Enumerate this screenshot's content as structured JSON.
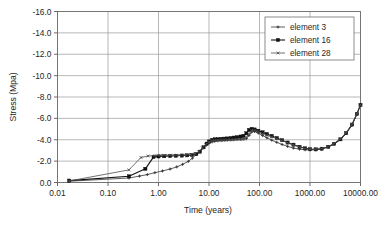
{
  "chart_data": {
    "type": "line",
    "title": "",
    "xlabel": "Time (years)",
    "ylabel": "Stress (Mpa)",
    "xscale": "log",
    "xlim": [
      0.01,
      10000
    ],
    "ylim": [
      0.0,
      -16.0
    ],
    "grid": true,
    "legend_position": "top-right",
    "xticks": [
      0.01,
      0.1,
      1,
      10,
      100,
      1000,
      10000
    ],
    "xtick_labels": [
      "0.01",
      "0.10",
      "1.00",
      "10.00",
      "100.00",
      "1000.00",
      "10000.00"
    ],
    "yticks": [
      -16.0,
      -14.0,
      -12.0,
      -10.0,
      -8.0,
      -6.0,
      -4.0,
      -2.0,
      0.0
    ],
    "ytick_labels": [
      "-16.0",
      "-14.0",
      "-12.0",
      "-10.0",
      "-8.0",
      "-6.0",
      "-4.0",
      "-2.0",
      "0.0"
    ],
    "series": [
      {
        "name": "element 3",
        "color": "#333333",
        "marker": "plus",
        "line_width": 0.8,
        "points": [
          [
            0.017,
            -0.12
          ],
          [
            0.26,
            -0.42
          ],
          [
            0.42,
            -0.6
          ],
          [
            0.6,
            -0.74
          ],
          [
            0.85,
            -0.92
          ],
          [
            1.2,
            -1.08
          ],
          [
            1.7,
            -1.26
          ],
          [
            2.3,
            -1.46
          ],
          [
            3.0,
            -1.7
          ],
          [
            3.9,
            -1.98
          ],
          [
            4.7,
            -2.28
          ],
          [
            5.6,
            -2.62
          ],
          [
            6.5,
            -2.92
          ],
          [
            7.6,
            -3.22
          ],
          [
            8.8,
            -3.48
          ],
          [
            10.0,
            -3.68
          ],
          [
            11.5,
            -3.8
          ],
          [
            13.0,
            -3.86
          ],
          [
            15.0,
            -3.9
          ],
          [
            17.5,
            -3.92
          ],
          [
            20.0,
            -3.94
          ],
          [
            23.0,
            -3.96
          ],
          [
            27.0,
            -3.98
          ],
          [
            31.0,
            -4.0
          ],
          [
            36.0,
            -4.02
          ],
          [
            42.0,
            -4.04
          ],
          [
            48.0,
            -4.06
          ],
          [
            55.0,
            -4.1
          ],
          [
            62.0,
            -4.4
          ],
          [
            70.0,
            -4.72
          ],
          [
            80.0,
            -4.78
          ],
          [
            95.0,
            -4.62
          ],
          [
            115.0,
            -4.4
          ],
          [
            140.0,
            -4.18
          ],
          [
            175.0,
            -3.96
          ],
          [
            220.0,
            -3.76
          ],
          [
            280.0,
            -3.56
          ],
          [
            360.0,
            -3.38
          ],
          [
            470.0,
            -3.22
          ],
          [
            620.0,
            -3.12
          ],
          [
            800.0,
            -3.06
          ],
          [
            1000.0,
            -3.04
          ],
          [
            1300.0,
            -3.06
          ],
          [
            1700.0,
            -3.14
          ],
          [
            2300.0,
            -3.32
          ],
          [
            3000.0,
            -3.6
          ],
          [
            4000.0,
            -4.02
          ],
          [
            5200.0,
            -4.6
          ],
          [
            6800.0,
            -5.4
          ],
          [
            8500.0,
            -6.4
          ],
          [
            10000.0,
            -7.3
          ]
        ]
      },
      {
        "name": "element 16",
        "color": "#111111",
        "marker": "square",
        "line_width": 1.1,
        "points": [
          [
            0.017,
            -0.18
          ],
          [
            0.26,
            -0.58
          ],
          [
            0.55,
            -1.28
          ],
          [
            0.8,
            -2.4
          ],
          [
            1.0,
            -2.44
          ],
          [
            1.3,
            -2.46
          ],
          [
            1.7,
            -2.48
          ],
          [
            2.2,
            -2.5
          ],
          [
            2.9,
            -2.52
          ],
          [
            3.7,
            -2.54
          ],
          [
            4.6,
            -2.58
          ],
          [
            5.6,
            -2.66
          ],
          [
            6.6,
            -2.88
          ],
          [
            7.8,
            -3.3
          ],
          [
            9.0,
            -3.64
          ],
          [
            10.0,
            -3.84
          ],
          [
            11.5,
            -3.98
          ],
          [
            13.0,
            -4.04
          ],
          [
            15.0,
            -4.06
          ],
          [
            17.5,
            -4.08
          ],
          [
            20.0,
            -4.1
          ],
          [
            23.0,
            -4.12
          ],
          [
            27.0,
            -4.16
          ],
          [
            31.0,
            -4.2
          ],
          [
            36.0,
            -4.24
          ],
          [
            42.0,
            -4.3
          ],
          [
            48.0,
            -4.36
          ],
          [
            55.0,
            -4.6
          ],
          [
            62.0,
            -4.92
          ],
          [
            70.0,
            -5.02
          ],
          [
            80.0,
            -4.96
          ],
          [
            95.0,
            -4.84
          ],
          [
            115.0,
            -4.7
          ],
          [
            140.0,
            -4.54
          ],
          [
            175.0,
            -4.36
          ],
          [
            220.0,
            -4.16
          ],
          [
            280.0,
            -3.96
          ],
          [
            360.0,
            -3.74
          ],
          [
            470.0,
            -3.54
          ],
          [
            620.0,
            -3.34
          ],
          [
            800.0,
            -3.2
          ],
          [
            1000.0,
            -3.12
          ],
          [
            1300.0,
            -3.1
          ],
          [
            1700.0,
            -3.16
          ],
          [
            2300.0,
            -3.34
          ],
          [
            3000.0,
            -3.62
          ],
          [
            4000.0,
            -4.04
          ],
          [
            5200.0,
            -4.62
          ],
          [
            6800.0,
            -5.42
          ],
          [
            8500.0,
            -6.42
          ],
          [
            10000.0,
            -7.26
          ]
        ]
      },
      {
        "name": "element 28",
        "color": "#4d4d4d",
        "marker": "cross",
        "line_width": 0.8,
        "points": [
          [
            0.017,
            -0.14
          ],
          [
            0.26,
            -1.18
          ],
          [
            0.45,
            -2.34
          ],
          [
            0.62,
            -2.48
          ],
          [
            0.85,
            -2.52
          ],
          [
            1.1,
            -2.54
          ],
          [
            1.5,
            -2.54
          ],
          [
            2.0,
            -2.56
          ],
          [
            2.6,
            -2.56
          ],
          [
            3.4,
            -2.58
          ],
          [
            4.3,
            -2.62
          ],
          [
            5.3,
            -2.7
          ],
          [
            6.3,
            -2.9
          ],
          [
            7.4,
            -3.24
          ],
          [
            8.6,
            -3.56
          ],
          [
            10.0,
            -3.78
          ],
          [
            11.5,
            -3.9
          ],
          [
            13.0,
            -3.94
          ],
          [
            15.0,
            -3.96
          ],
          [
            17.5,
            -3.98
          ],
          [
            20.0,
            -3.98
          ],
          [
            23.0,
            -4.0
          ],
          [
            27.0,
            -4.0
          ],
          [
            31.0,
            -4.02
          ],
          [
            36.0,
            -4.02
          ],
          [
            42.0,
            -4.04
          ],
          [
            48.0,
            -4.06
          ],
          [
            55.0,
            -4.24
          ],
          [
            62.0,
            -4.56
          ],
          [
            70.0,
            -4.88
          ],
          [
            80.0,
            -4.9
          ],
          [
            95.0,
            -4.76
          ],
          [
            115.0,
            -4.58
          ],
          [
            140.0,
            -4.42
          ],
          [
            175.0,
            -4.26
          ],
          [
            220.0,
            -4.1
          ],
          [
            280.0,
            -3.92
          ],
          [
            360.0,
            -3.72
          ],
          [
            470.0,
            -3.52
          ],
          [
            620.0,
            -3.32
          ],
          [
            800.0,
            -3.18
          ],
          [
            1000.0,
            -3.1
          ],
          [
            1300.0,
            -3.1
          ],
          [
            1700.0,
            -3.18
          ],
          [
            2300.0,
            -3.36
          ],
          [
            3000.0,
            -3.64
          ],
          [
            4000.0,
            -4.06
          ],
          [
            5200.0,
            -4.64
          ],
          [
            6800.0,
            -5.44
          ],
          [
            8500.0,
            -6.44
          ],
          [
            10000.0,
            -7.28
          ]
        ]
      }
    ]
  },
  "legend": {
    "items": [
      {
        "label": "element 3"
      },
      {
        "label": "element 16"
      },
      {
        "label": "element 28"
      }
    ]
  },
  "colors": {
    "grid": "#9a9a9a",
    "frame": "#6f6f6f",
    "text": "#1f1f1f",
    "background": "#ffffff"
  }
}
